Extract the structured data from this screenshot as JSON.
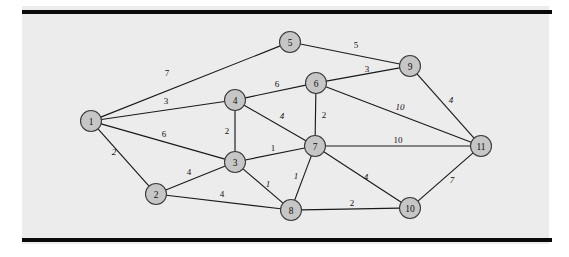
{
  "figure": {
    "background_color": "#ececec",
    "page_color": "#ffffff",
    "rule_color": "#0a0a0a",
    "node_fill": "#c6c6c6",
    "node_stroke": "#3a3a3a",
    "edge_color": "#1a1a1a"
  },
  "chart_data": {
    "type": "diagram",
    "diagram_type": "weighted-undirected-graph",
    "title": "",
    "xlabel": "",
    "ylabel": "",
    "nodes": [
      {
        "id": "1",
        "label": "1",
        "x": 91,
        "y": 121
      },
      {
        "id": "2",
        "label": "2",
        "x": 156,
        "y": 194
      },
      {
        "id": "3",
        "label": "3",
        "x": 235,
        "y": 162
      },
      {
        "id": "4",
        "label": "4",
        "x": 235,
        "y": 100
      },
      {
        "id": "5",
        "label": "5",
        "x": 290,
        "y": 42
      },
      {
        "id": "6",
        "label": "6",
        "x": 316,
        "y": 83
      },
      {
        "id": "7",
        "label": "7",
        "x": 315,
        "y": 146
      },
      {
        "id": "8",
        "label": "8",
        "x": 291,
        "y": 210
      },
      {
        "id": "9",
        "label": "9",
        "x": 410,
        "y": 66
      },
      {
        "id": "10",
        "label": "10",
        "x": 410,
        "y": 208
      },
      {
        "id": "11",
        "label": "11",
        "x": 481,
        "y": 146
      }
    ],
    "node_radius": 10.5,
    "edges": [
      {
        "source": "1",
        "target": "5",
        "weight": "7",
        "lx": 167,
        "ly": 73,
        "slanted": false
      },
      {
        "source": "1",
        "target": "4",
        "weight": "3",
        "lx": 166,
        "ly": 101,
        "slanted": false
      },
      {
        "source": "1",
        "target": "3",
        "weight": "6",
        "lx": 164,
        "ly": 134,
        "slanted": false
      },
      {
        "source": "1",
        "target": "2",
        "weight": "2",
        "lx": 114,
        "ly": 152,
        "slanted": true
      },
      {
        "source": "2",
        "target": "3",
        "weight": "4",
        "lx": 189,
        "ly": 172,
        "slanted": false
      },
      {
        "source": "2",
        "target": "8",
        "weight": "4",
        "lx": 222,
        "ly": 194,
        "slanted": false
      },
      {
        "source": "3",
        "target": "4",
        "weight": "2",
        "lx": 227,
        "ly": 131,
        "slanted": false
      },
      {
        "source": "3",
        "target": "7",
        "weight": "1",
        "lx": 273,
        "ly": 148,
        "slanted": false
      },
      {
        "source": "3",
        "target": "8",
        "weight": "1",
        "lx": 268,
        "ly": 184,
        "slanted": true
      },
      {
        "source": "4",
        "target": "6",
        "weight": "6",
        "lx": 277,
        "ly": 84,
        "slanted": false
      },
      {
        "source": "4",
        "target": "7",
        "weight": "4",
        "lx": 282,
        "ly": 116,
        "slanted": true
      },
      {
        "source": "5",
        "target": "9",
        "weight": "5",
        "lx": 356,
        "ly": 45,
        "slanted": false
      },
      {
        "source": "6",
        "target": "9",
        "weight": "3",
        "lx": 367,
        "ly": 69,
        "slanted": false
      },
      {
        "source": "6",
        "target": "7",
        "weight": "2",
        "lx": 324,
        "ly": 115,
        "slanted": false
      },
      {
        "source": "6",
        "target": "11",
        "weight": "10",
        "lx": 400,
        "ly": 107,
        "slanted": true
      },
      {
        "source": "7",
        "target": "8",
        "weight": "1",
        "lx": 296,
        "ly": 176,
        "slanted": true
      },
      {
        "source": "7",
        "target": "10",
        "weight": "4",
        "lx": 366,
        "ly": 177,
        "slanted": true
      },
      {
        "source": "7",
        "target": "11",
        "weight": "10",
        "lx": 398,
        "ly": 140,
        "slanted": false
      },
      {
        "source": "8",
        "target": "10",
        "weight": "2",
        "lx": 352,
        "ly": 203,
        "slanted": false
      },
      {
        "source": "9",
        "target": "11",
        "weight": "4",
        "lx": 451,
        "ly": 100,
        "slanted": true
      },
      {
        "source": "10",
        "target": "11",
        "weight": "7",
        "lx": 452,
        "ly": 180,
        "slanted": true
      }
    ],
    "rules": [
      {
        "name": "top-rule",
        "x1": 22,
        "y1": 12,
        "x2": 552,
        "y2": 12,
        "width": 4
      },
      {
        "name": "bottom-rule",
        "x1": 22,
        "y1": 240,
        "x2": 552,
        "y2": 240,
        "width": 4
      }
    ]
  }
}
